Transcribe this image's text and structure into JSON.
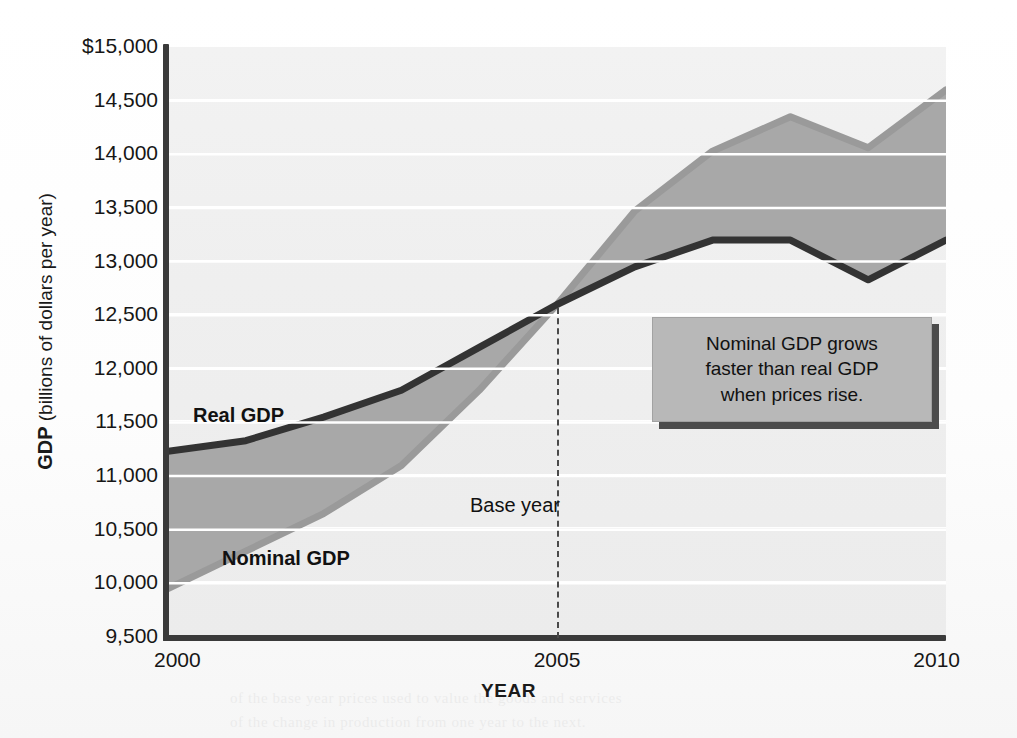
{
  "figure": {
    "y_axis_title_strong": "GDP",
    "y_axis_title_rest": " (billions of dollars per year)",
    "x_axis_title": "YEAR",
    "base_year_label": "Base year",
    "callout_line1": "Nominal GDP grows",
    "callout_line2": "faster than real GDP",
    "callout_line3": "when prices rise.",
    "label_real": "Real GDP",
    "label_nominal": "Nominal GDP"
  },
  "colors": {
    "real_gdp_line": "#333333",
    "nominal_gdp_line": "#9a9a9a",
    "between_fill": "#a8a8a8",
    "plot_background": "#efefef",
    "gridline": "#ffffff",
    "axis": "#3a3a3a",
    "callout_background": "#b8b8b8",
    "callout_shadow": "#4c4c4c",
    "base_year_dash": "#4a4a4a"
  },
  "bleed_text": [
    "of the base year prices used to value the goods and services",
    "produced. Nominal GDP rises when prices rise even though",
    "output is unchanged, so real GDP is the better measure",
    "of the change in production from one year to the next.",
    "a period when the price level is rising, nominal GDP grows",
    "faster than real GDP. In 1997, or 1998, the two measures",
    "were equal because the base year values coincide, and",
    "the price level and output grew at different rates thereafter."
  ],
  "chart_data": {
    "type": "line",
    "title": "",
    "xlabel": "YEAR",
    "ylabel": "GDP (billions of dollars per year)",
    "x": [
      2000,
      2001,
      2002,
      2003,
      2004,
      2005,
      2006,
      2007,
      2008,
      2009,
      2010
    ],
    "xlim": [
      2000,
      2010
    ],
    "ylim": [
      9500,
      15000
    ],
    "yticks": [
      9500,
      10000,
      10500,
      11000,
      11500,
      12000,
      12500,
      13000,
      13500,
      14000,
      14500,
      15000
    ],
    "ytick_labels": [
      "9,500",
      "10,000",
      "10,500",
      "11,000",
      "11,500",
      "12,000",
      "12,500",
      "13,000",
      "13,500",
      "14,000",
      "14,500",
      "$15,000"
    ],
    "xticks": [
      2000,
      2005,
      2010
    ],
    "xtick_labels": [
      "2000",
      "2005",
      "2010"
    ],
    "grid": "horizontal",
    "legend": "inline-labels",
    "series": [
      {
        "name": "Real GDP",
        "color": "#333333",
        "values": [
          11230,
          11330,
          11550,
          11800,
          12200,
          12600,
          12950,
          13200,
          13200,
          12830,
          13200
        ]
      },
      {
        "name": "Nominal GDP",
        "color": "#9a9a9a",
        "values": [
          9950,
          10300,
          10650,
          11100,
          11800,
          12600,
          13470,
          14030,
          14350,
          14060,
          14600
        ]
      }
    ],
    "annotations": [
      {
        "text": "Base year",
        "x": 2005,
        "type": "vertical-dashed-line"
      },
      {
        "text": "Nominal GDP grows faster than real GDP when prices rise.",
        "type": "callout-box"
      }
    ]
  }
}
